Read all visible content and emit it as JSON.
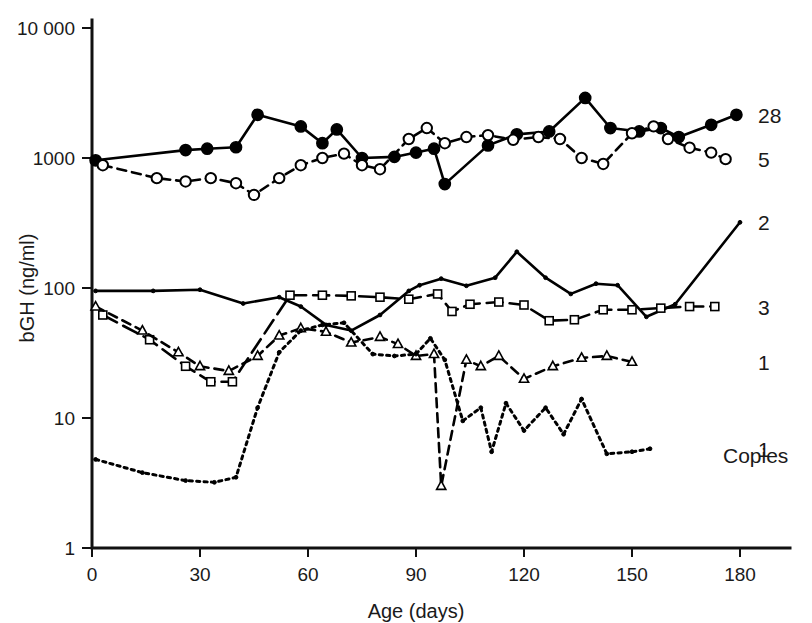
{
  "chart_data": {
    "type": "line",
    "title": "",
    "xlabel": "Age (days)",
    "ylabel": "bGH (ng/ml)",
    "yscale": "log",
    "xlim": [
      0,
      190
    ],
    "ylim": [
      1,
      10000
    ],
    "grid": false,
    "legend_position": "right",
    "legend_header": "Copies",
    "xticks": [
      0,
      30,
      60,
      90,
      120,
      150,
      180
    ],
    "xticklabels": [
      "0",
      "30",
      "60",
      "90",
      "120",
      "150",
      "180"
    ],
    "yticks": [
      1,
      10,
      100,
      1000,
      10000
    ],
    "yticklabels": [
      "1",
      "10",
      "100",
      "1000",
      "10 000"
    ],
    "series": [
      {
        "name": "28",
        "label": "28",
        "copies": 28,
        "marker": "filled-circle",
        "linestyle": "solid",
        "color": "#000000",
        "points": [
          [
            1,
            960
          ],
          [
            26,
            1150
          ],
          [
            32,
            1180
          ],
          [
            40,
            1210
          ],
          [
            46,
            2150
          ],
          [
            58,
            1750
          ],
          [
            64,
            1300
          ],
          [
            68,
            1660
          ],
          [
            75,
            1000
          ],
          [
            84,
            1020
          ],
          [
            90,
            1100
          ],
          [
            95,
            1180
          ],
          [
            98,
            630
          ],
          [
            110,
            1250
          ],
          [
            118,
            1520
          ],
          [
            127,
            1600
          ],
          [
            137,
            2900
          ],
          [
            144,
            1700
          ],
          [
            152,
            1600
          ],
          [
            158,
            1700
          ],
          [
            163,
            1450
          ],
          [
            172,
            1800
          ],
          [
            179,
            2150
          ]
        ]
      },
      {
        "name": "5",
        "label": "5",
        "copies": 5,
        "marker": "open-circle",
        "linestyle": "dashed",
        "color": "#000000",
        "points": [
          [
            3,
            880
          ],
          [
            18,
            700
          ],
          [
            26,
            660
          ],
          [
            33,
            700
          ],
          [
            40,
            640
          ],
          [
            45,
            520
          ],
          [
            52,
            700
          ],
          [
            58,
            880
          ],
          [
            64,
            1000
          ],
          [
            70,
            1080
          ],
          [
            75,
            880
          ],
          [
            80,
            820
          ],
          [
            88,
            1400
          ],
          [
            93,
            1700
          ],
          [
            98,
            1300
          ],
          [
            104,
            1450
          ],
          [
            110,
            1500
          ],
          [
            117,
            1380
          ],
          [
            124,
            1450
          ],
          [
            130,
            1400
          ],
          [
            136,
            1000
          ],
          [
            142,
            900
          ],
          [
            150,
            1550
          ],
          [
            156,
            1750
          ],
          [
            160,
            1400
          ],
          [
            166,
            1200
          ],
          [
            172,
            1100
          ],
          [
            176,
            980
          ]
        ]
      },
      {
        "name": "2",
        "label": "2",
        "copies": 2,
        "marker": "dot",
        "linestyle": "solid",
        "color": "#000000",
        "points": [
          [
            1,
            95
          ],
          [
            17,
            95
          ],
          [
            30,
            97
          ],
          [
            42,
            76
          ],
          [
            52,
            85
          ],
          [
            58,
            72
          ],
          [
            65,
            52
          ],
          [
            72,
            47
          ],
          [
            80,
            62
          ],
          [
            88,
            95
          ],
          [
            91,
            105
          ],
          [
            97,
            118
          ],
          [
            104,
            104
          ],
          [
            112,
            120
          ],
          [
            118,
            190
          ],
          [
            126,
            120
          ],
          [
            133,
            90
          ],
          [
            140,
            108
          ],
          [
            146,
            105
          ],
          [
            154,
            60
          ],
          [
            162,
            75
          ],
          [
            180,
            320
          ]
        ]
      },
      {
        "name": "3",
        "label": "3",
        "copies": 3,
        "marker": "square",
        "linestyle": "longdash",
        "color": "#000000",
        "points": [
          [
            3,
            62
          ],
          [
            16,
            40
          ],
          [
            26,
            25
          ],
          [
            33,
            19
          ],
          [
            39,
            19
          ],
          [
            55,
            88
          ],
          [
            64,
            88
          ],
          [
            72,
            87
          ],
          [
            80,
            85
          ],
          [
            88,
            82
          ],
          [
            96,
            90
          ],
          [
            100,
            66
          ],
          [
            105,
            75
          ],
          [
            113,
            78
          ],
          [
            120,
            74
          ],
          [
            127,
            56
          ],
          [
            134,
            57
          ],
          [
            142,
            68
          ],
          [
            150,
            68
          ],
          [
            158,
            70
          ],
          [
            166,
            72
          ],
          [
            173,
            72
          ]
        ]
      },
      {
        "name": "1a",
        "label": "1",
        "copies": 1,
        "marker": "triangle",
        "linestyle": "dashed",
        "color": "#000000",
        "points": [
          [
            1,
            72
          ],
          [
            14,
            47
          ],
          [
            24,
            32
          ],
          [
            30,
            25
          ],
          [
            38,
            23
          ],
          [
            46,
            30
          ],
          [
            52,
            43
          ],
          [
            58,
            49
          ],
          [
            65,
            46
          ],
          [
            72,
            38
          ],
          [
            80,
            42
          ],
          [
            85,
            37
          ],
          [
            90,
            30
          ],
          [
            95,
            31
          ],
          [
            97,
            3.0
          ],
          [
            104,
            28
          ],
          [
            108,
            25
          ],
          [
            113,
            30
          ],
          [
            120,
            20
          ],
          [
            128,
            25
          ],
          [
            136,
            29
          ],
          [
            143,
            30
          ],
          [
            150,
            27
          ]
        ]
      },
      {
        "name": "1b",
        "label": "1",
        "copies": 1,
        "marker": "dot",
        "linestyle": "dotted",
        "color": "#000000",
        "points": [
          [
            1,
            4.8
          ],
          [
            14,
            3.8
          ],
          [
            26,
            3.3
          ],
          [
            34,
            3.2
          ],
          [
            40,
            3.5
          ],
          [
            46,
            12
          ],
          [
            52,
            32
          ],
          [
            58,
            47
          ],
          [
            64,
            52
          ],
          [
            70,
            54
          ],
          [
            78,
            31
          ],
          [
            84,
            30
          ],
          [
            90,
            31
          ],
          [
            94,
            41
          ],
          [
            98,
            28
          ],
          [
            103,
            9.5
          ],
          [
            108,
            12
          ],
          [
            111,
            5.5
          ],
          [
            115,
            13
          ],
          [
            120,
            8.0
          ],
          [
            126,
            12
          ],
          [
            131,
            7.5
          ],
          [
            136,
            14
          ],
          [
            143,
            5.3
          ],
          [
            150,
            5.5
          ],
          [
            155,
            5.8
          ]
        ]
      }
    ],
    "series_labels_right": [
      {
        "label": "28",
        "y_value": 2150
      },
      {
        "label": "5",
        "y_value": 980
      },
      {
        "label": "2",
        "y_value": 320
      },
      {
        "label": "3",
        "y_value": 72
      },
      {
        "label": "1",
        "y_value": 27
      },
      {
        "label": "1",
        "y_value": 5.8
      }
    ]
  }
}
